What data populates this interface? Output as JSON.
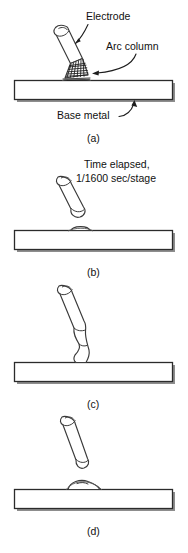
{
  "figure": {
    "labels": {
      "electrode": "Electrode",
      "arc_column": "Arc column",
      "base_metal": "Base metal",
      "time_elapsed_line1": "Time elapsed,",
      "time_elapsed_line2": "1/1600 sec/stage"
    },
    "captions": {
      "a": "(a)",
      "b": "(b)",
      "c": "(c)",
      "d": "(d)"
    },
    "colors": {
      "ink": "#1d1d1d",
      "outline": "#3a3a3a",
      "plate_stroke": "#2b2b2b",
      "plate_fill": "#ffffff",
      "plate_shadow": "#8d8d8d",
      "background": "#ffffff"
    },
    "panels": [
      {
        "id": "a",
        "caption": "(a)",
        "description": "Electrode tilted above base metal with arc column struck at tip",
        "annotations": [
          "Electrode",
          "Arc column",
          "Base metal"
        ]
      },
      {
        "id": "b",
        "caption": "(b)",
        "description": "Electrode tip melting, molten droplet forming, small bead on plate",
        "annotations": [
          "Time elapsed,",
          "1/1600 sec/stage"
        ]
      },
      {
        "id": "c",
        "caption": "(c)",
        "description": "Molten metal necking down and bridging from electrode to base metal",
        "annotations": []
      },
      {
        "id": "d",
        "caption": "(d)",
        "description": "Droplet detached and deposited as weld bead on base metal",
        "annotations": []
      }
    ]
  }
}
